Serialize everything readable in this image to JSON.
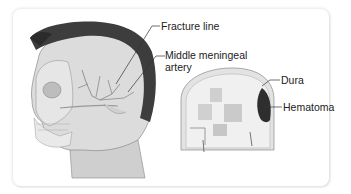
{
  "figure": {
    "panels": [
      {
        "name": "lateral-head-view",
        "description": "Side view of head with skull showing fracture line and middle meningeal artery"
      },
      {
        "name": "coronal-section-view",
        "description": "Coronal cross-section of skull showing dura and hematoma"
      }
    ],
    "labels": {
      "fracture_line": "Fracture line",
      "middle_meningeal_artery_1": "Middle meningeal",
      "middle_meningeal_artery_2": "artery",
      "dura": "Dura",
      "hematoma": "Hematoma"
    },
    "colors": {
      "background": "#ffffff",
      "card_border": "#e0e0e0",
      "hair": "#3a3a3a",
      "skin": "#d4d4d4",
      "bone": "#e8e8e8",
      "hematoma": "#2e2e2e",
      "label_text": "#222222"
    }
  }
}
